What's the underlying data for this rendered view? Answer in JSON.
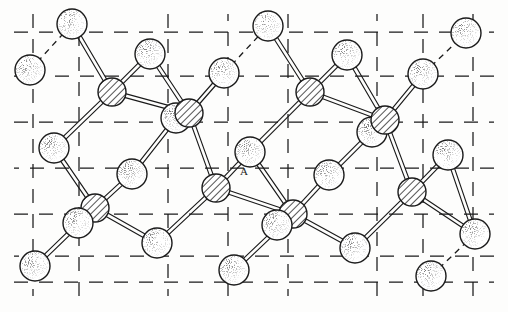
{
  "figure": {
    "background_color": "#fdfdfc",
    "line_color": "#1a1a1a",
    "annotation_label": "A"
  },
  "legend": {
    "atom_types": [
      {
        "id": "hatched",
        "name": "hatched-atom",
        "fill_style": "diagonal-hatch",
        "radius": 14
      },
      {
        "id": "stippled",
        "name": "stippled-atom",
        "fill_style": "stipple-dots",
        "radius": 15
      }
    ],
    "bond_style": "double-line",
    "cell_edge_style": "dashed"
  },
  "cell_grid": {
    "stroke": "#1a1a1a",
    "dash": "14 11",
    "vertical_x": [
      33,
      79,
      168,
      228,
      288,
      377,
      423,
      473
    ],
    "vertical_spans": [
      [
        14,
        296
      ]
    ],
    "horizontal_y": [
      32,
      76,
      122,
      168,
      214,
      256,
      282
    ],
    "horizontal_spans": [
      [
        14,
        494
      ]
    ]
  },
  "atoms": [
    {
      "name": "stippled-atom",
      "type": "stippled",
      "x": 72,
      "y": 24,
      "r": 15
    },
    {
      "name": "stippled-atom",
      "type": "stippled",
      "x": 30,
      "y": 70,
      "r": 15
    },
    {
      "name": "stippled-atom",
      "type": "stippled",
      "x": 150,
      "y": 54,
      "r": 15
    },
    {
      "name": "stippled-atom",
      "type": "stippled",
      "x": 224,
      "y": 73,
      "r": 15
    },
    {
      "name": "stippled-atom",
      "type": "stippled",
      "x": 268,
      "y": 26,
      "r": 15
    },
    {
      "name": "stippled-atom",
      "type": "stippled",
      "x": 347,
      "y": 55,
      "r": 15
    },
    {
      "name": "stippled-atom",
      "type": "stippled",
      "x": 423,
      "y": 74,
      "r": 15
    },
    {
      "name": "stippled-atom",
      "type": "stippled",
      "x": 466,
      "y": 33,
      "r": 15
    },
    {
      "name": "hatched-atom",
      "type": "hatched",
      "x": 112,
      "y": 92,
      "r": 14
    },
    {
      "name": "hatched-atom",
      "type": "hatched",
      "x": 310,
      "y": 92,
      "r": 14
    },
    {
      "name": "stippled-atom",
      "type": "stippled",
      "x": 176,
      "y": 118,
      "r": 15
    },
    {
      "name": "hatched-atom",
      "type": "hatched",
      "x": 189,
      "y": 113,
      "r": 14
    },
    {
      "name": "stippled-atom",
      "type": "stippled",
      "x": 372,
      "y": 132,
      "r": 15
    },
    {
      "name": "hatched-atom",
      "type": "hatched",
      "x": 385,
      "y": 120,
      "r": 14
    },
    {
      "name": "stippled-atom",
      "type": "stippled",
      "x": 54,
      "y": 148,
      "r": 15
    },
    {
      "name": "stippled-atom",
      "type": "stippled",
      "x": 250,
      "y": 152,
      "r": 15
    },
    {
      "name": "stippled-atom",
      "type": "stippled",
      "x": 448,
      "y": 155,
      "r": 15
    },
    {
      "name": "stippled-atom",
      "type": "stippled",
      "x": 132,
      "y": 174,
      "r": 15
    },
    {
      "name": "stippled-atom",
      "type": "stippled",
      "x": 329,
      "y": 175,
      "r": 15
    },
    {
      "name": "hatched-atom",
      "type": "hatched",
      "x": 216,
      "y": 188,
      "r": 14
    },
    {
      "name": "hatched-atom",
      "type": "hatched",
      "x": 412,
      "y": 192,
      "r": 14
    },
    {
      "name": "hatched-atom",
      "type": "hatched",
      "x": 95,
      "y": 208,
      "r": 14
    },
    {
      "name": "stippled-atom",
      "type": "stippled",
      "x": 78,
      "y": 223,
      "r": 15
    },
    {
      "name": "hatched-atom",
      "type": "hatched",
      "x": 293,
      "y": 214,
      "r": 14
    },
    {
      "name": "stippled-atom",
      "type": "stippled",
      "x": 277,
      "y": 225,
      "r": 15
    },
    {
      "name": "stippled-atom",
      "type": "stippled",
      "x": 157,
      "y": 243,
      "r": 15
    },
    {
      "name": "stippled-atom",
      "type": "stippled",
      "x": 355,
      "y": 248,
      "r": 15
    },
    {
      "name": "stippled-atom",
      "type": "stippled",
      "x": 35,
      "y": 266,
      "r": 15
    },
    {
      "name": "stippled-atom",
      "type": "stippled",
      "x": 234,
      "y": 270,
      "r": 15
    },
    {
      "name": "stippled-atom",
      "type": "stippled",
      "x": 431,
      "y": 276,
      "r": 15
    },
    {
      "name": "stippled-atom",
      "type": "stippled",
      "x": 475,
      "y": 234,
      "r": 15
    }
  ],
  "bonds": [
    {
      "from": [
        72,
        24
      ],
      "to": [
        112,
        92
      ]
    },
    {
      "from": [
        150,
        54
      ],
      "to": [
        112,
        92
      ]
    },
    {
      "from": [
        112,
        92
      ],
      "to": [
        54,
        148
      ]
    },
    {
      "from": [
        112,
        92
      ],
      "to": [
        189,
        113
      ]
    },
    {
      "from": [
        150,
        54
      ],
      "to": [
        189,
        113
      ]
    },
    {
      "from": [
        224,
        73
      ],
      "to": [
        189,
        113
      ]
    },
    {
      "from": [
        189,
        113
      ],
      "to": [
        216,
        188
      ]
    },
    {
      "from": [
        176,
        118
      ],
      "to": [
        132,
        174
      ]
    },
    {
      "from": [
        268,
        26
      ],
      "to": [
        310,
        92
      ]
    },
    {
      "from": [
        347,
        55
      ],
      "to": [
        310,
        92
      ]
    },
    {
      "from": [
        310,
        92
      ],
      "to": [
        250,
        152
      ]
    },
    {
      "from": [
        310,
        92
      ],
      "to": [
        385,
        120
      ]
    },
    {
      "from": [
        347,
        55
      ],
      "to": [
        385,
        120
      ]
    },
    {
      "from": [
        423,
        74
      ],
      "to": [
        385,
        120
      ]
    },
    {
      "from": [
        385,
        120
      ],
      "to": [
        412,
        192
      ]
    },
    {
      "from": [
        372,
        132
      ],
      "to": [
        329,
        175
      ]
    },
    {
      "from": [
        54,
        148
      ],
      "to": [
        95,
        208
      ]
    },
    {
      "from": [
        132,
        174
      ],
      "to": [
        95,
        208
      ]
    },
    {
      "from": [
        95,
        208
      ],
      "to": [
        35,
        266
      ]
    },
    {
      "from": [
        95,
        208
      ],
      "to": [
        157,
        243
      ]
    },
    {
      "from": [
        216,
        188
      ],
      "to": [
        157,
        243
      ]
    },
    {
      "from": [
        216,
        188
      ],
      "to": [
        293,
        214
      ]
    },
    {
      "from": [
        250,
        152
      ],
      "to": [
        293,
        214
      ]
    },
    {
      "from": [
        293,
        214
      ],
      "to": [
        234,
        270
      ]
    },
    {
      "from": [
        293,
        214
      ],
      "to": [
        355,
        248
      ]
    },
    {
      "from": [
        329,
        175
      ],
      "to": [
        293,
        214
      ]
    },
    {
      "from": [
        412,
        192
      ],
      "to": [
        355,
        248
      ]
    },
    {
      "from": [
        412,
        192
      ],
      "to": [
        475,
        234
      ]
    },
    {
      "from": [
        448,
        155
      ],
      "to": [
        412,
        192
      ]
    },
    {
      "from": [
        250,
        152
      ],
      "to": [
        216,
        188
      ]
    },
    {
      "from": [
        448,
        155
      ],
      "to": [
        475,
        234
      ]
    }
  ],
  "dashed_bonds": [
    {
      "from": [
        30,
        70
      ],
      "to": [
        72,
        24
      ]
    },
    {
      "from": [
        224,
        73
      ],
      "to": [
        268,
        26
      ]
    },
    {
      "from": [
        423,
        74
      ],
      "to": [
        466,
        33
      ]
    },
    {
      "from": [
        431,
        276
      ],
      "to": [
        475,
        234
      ]
    }
  ]
}
